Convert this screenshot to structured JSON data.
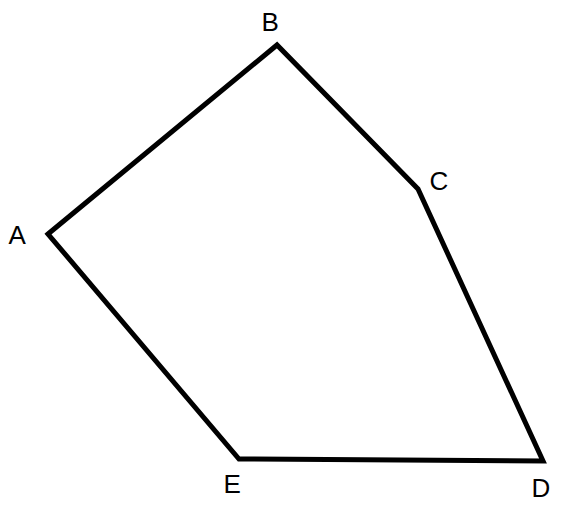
{
  "figure": {
    "kind": "geometry-diagram",
    "shape_name": "pentagon",
    "background_color": "#ffffff",
    "stroke_color": "#000000",
    "stroke_width": 5,
    "fill": "none",
    "canvas": {
      "width": 565,
      "height": 525
    },
    "vertices": [
      {
        "id": "A",
        "label": "A",
        "x": 48,
        "y": 234,
        "label_x": 23,
        "label_y": 235
      },
      {
        "id": "B",
        "label": "B",
        "x": 277,
        "y": 45,
        "label_x": 276,
        "label_y": 22
      },
      {
        "id": "C",
        "label": "C",
        "x": 418,
        "y": 189,
        "label_x": 444,
        "label_y": 181
      },
      {
        "id": "D",
        "label": "D",
        "x": 543,
        "y": 461,
        "label_x": 546,
        "label_y": 488
      },
      {
        "id": "E",
        "label": "E",
        "x": 239,
        "y": 459,
        "label_x": 238,
        "label_y": 484
      }
    ],
    "edges": [
      {
        "from": "A",
        "to": "B"
      },
      {
        "from": "B",
        "to": "C"
      },
      {
        "from": "C",
        "to": "D"
      },
      {
        "from": "D",
        "to": "E"
      },
      {
        "from": "E",
        "to": "A"
      }
    ],
    "polygon_points": "48,234 277,45 418,189 543,461 239,459"
  }
}
